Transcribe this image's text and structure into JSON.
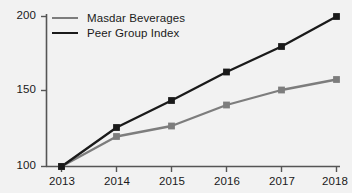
{
  "chart_data": {
    "type": "line",
    "title": "",
    "xlabel": "",
    "ylabel": "",
    "categories": [
      "2013",
      "2014",
      "2015",
      "2016",
      "2017",
      "2018"
    ],
    "series": [
      {
        "name": "Masdar Beverages",
        "color": "#7d7d7d",
        "marker": "square",
        "values": [
          100,
          120,
          127,
          141,
          151,
          158
        ]
      },
      {
        "name": "Peer Group Index",
        "color": "#1a1a1a",
        "marker": "square",
        "values": [
          100,
          126,
          144,
          163,
          180,
          200
        ]
      }
    ],
    "ylim": [
      100,
      200
    ],
    "yticks": [
      100,
      150,
      200
    ],
    "ytick_labels": [
      "100",
      "150",
      "200"
    ],
    "grid": false,
    "legend_position": "top-left-inside"
  },
  "axis": {
    "y_ticks": [
      "200",
      "150",
      "100"
    ],
    "x_ticks": [
      "2013",
      "2014",
      "2015",
      "2016",
      "2017",
      "2018"
    ]
  },
  "legend": {
    "entries": [
      {
        "label": "Masdar Beverages",
        "color": "#7d7d7d"
      },
      {
        "label": "Peer Group Index",
        "color": "#1a1a1a"
      }
    ]
  }
}
